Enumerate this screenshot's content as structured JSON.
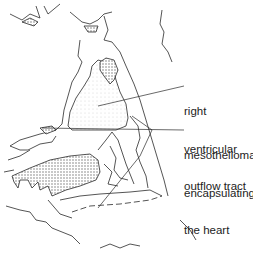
{
  "diagram": {
    "type": "anatomical line drawing",
    "labels": [
      {
        "id": "rvot",
        "lines": [
          "right",
          "ventricular",
          "outflow tract"
        ]
      },
      {
        "id": "meso",
        "lines": [
          "mesothelioma",
          "encapsulating",
          "the heart"
        ]
      }
    ],
    "colors": {
      "line": "#2a2a2a",
      "stipple": "#9a9a9a",
      "background": "#ffffff"
    }
  }
}
